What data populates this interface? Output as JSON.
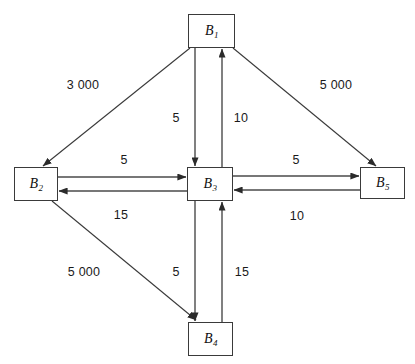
{
  "diagram": {
    "title": "",
    "background_color": "#ffffff",
    "line_color": "#3a3a3a",
    "text_color": "#111111",
    "nodes": [
      {
        "id": "B1",
        "base": "B",
        "sub": "1",
        "x": 188,
        "y": 14,
        "w": 47,
        "h": 34
      },
      {
        "id": "B2",
        "base": "B",
        "sub": "2",
        "x": 14,
        "y": 167,
        "w": 44,
        "h": 34
      },
      {
        "id": "B3",
        "base": "B",
        "sub": "3",
        "x": 187,
        "y": 167,
        "w": 46,
        "h": 34
      },
      {
        "id": "B5",
        "base": "B",
        "sub": "5",
        "x": 360,
        "y": 167,
        "w": 45,
        "h": 32
      },
      {
        "id": "B4",
        "base": "B",
        "sub": "4",
        "x": 188,
        "y": 322,
        "w": 45,
        "h": 34
      }
    ],
    "edges": [
      {
        "name": "edge-b1-b2",
        "from": "B1",
        "to": "B2",
        "label": "3 000",
        "label_x": 83,
        "label_y": 85
      },
      {
        "name": "edge-b1-b5",
        "from": "B1",
        "to": "B5",
        "label": "5 000",
        "label_x": 336,
        "label_y": 85
      },
      {
        "name": "edge-b1-b3",
        "from": "B1",
        "to": "B3",
        "label": "5",
        "label_x": 176,
        "label_y": 118
      },
      {
        "name": "edge-b3-b1",
        "from": "B3",
        "to": "B1",
        "label": "10",
        "label_x": 241,
        "label_y": 118
      },
      {
        "name": "edge-b2-b3",
        "from": "B2",
        "to": "B3",
        "label": "5",
        "label_x": 124,
        "label_y": 160
      },
      {
        "name": "edge-b3-b2",
        "from": "B3",
        "to": "B2",
        "label": "15",
        "label_x": 121,
        "label_y": 215
      },
      {
        "name": "edge-b3-b5",
        "from": "B3",
        "to": "B5",
        "label": "5",
        "label_x": 296,
        "label_y": 160
      },
      {
        "name": "edge-b5-b3",
        "from": "B5",
        "to": "B3",
        "label": "10",
        "label_x": 297,
        "label_y": 216
      },
      {
        "name": "edge-b2-b4",
        "from": "B2",
        "to": "B4",
        "label": "5 000",
        "label_x": 84,
        "label_y": 272
      },
      {
        "name": "edge-b3-b4",
        "from": "B3",
        "to": "B4",
        "label": "5",
        "label_x": 176,
        "label_y": 272
      },
      {
        "name": "edge-b4-b3",
        "from": "B4",
        "to": "B3",
        "label": "15",
        "label_x": 242,
        "label_y": 272
      }
    ]
  }
}
